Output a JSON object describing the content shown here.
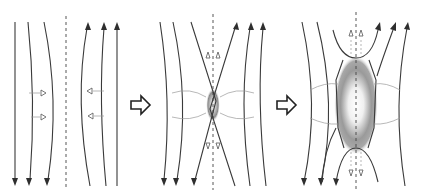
{
  "figure": {
    "panels": [
      {
        "id": "stage-1",
        "label": "antiparallel field lines with inflow"
      },
      {
        "id": "stage-2",
        "label": "X-point reconnection with small diffusion region"
      },
      {
        "id": "stage-3",
        "label": "extended diffusion region with reconnected loops and outflow"
      }
    ],
    "transition_arrows": 2,
    "colors": {
      "field_line": "#3a3a3a",
      "axis": "#444444",
      "diffusion_region": "#8a8a8a",
      "background": "#ffffff"
    }
  }
}
